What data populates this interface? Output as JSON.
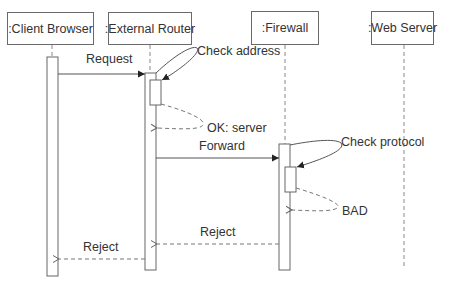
{
  "diagram": {
    "type": "sequence",
    "lifelines": [
      {
        "id": "client",
        "label": ":Client Browser"
      },
      {
        "id": "router",
        "label": ":External Router"
      },
      {
        "id": "firewall",
        "label": ":Firewall"
      },
      {
        "id": "webserver",
        "label": ":Web Server"
      }
    ],
    "messages": [
      {
        "from": "client",
        "to": "router",
        "label": "Request",
        "style": "solid"
      },
      {
        "from": "router",
        "to": "router",
        "label": "Check address",
        "style": "solid-self"
      },
      {
        "from": "router",
        "to": "router",
        "label": "OK: server",
        "style": "dashed-return"
      },
      {
        "from": "router",
        "to": "firewall",
        "label": "Forward",
        "style": "solid"
      },
      {
        "from": "firewall",
        "to": "firewall",
        "label": "Check protocol",
        "style": "solid-self"
      },
      {
        "from": "firewall",
        "to": "firewall",
        "label": "BAD",
        "style": "dashed-return"
      },
      {
        "from": "firewall",
        "to": "router",
        "label": "Reject",
        "style": "dashed-return"
      },
      {
        "from": "router",
        "to": "client",
        "label": "Reject",
        "style": "dashed-return"
      }
    ]
  },
  "colors": {
    "line": "#555555",
    "dashed": "#777777",
    "text": "#333333"
  }
}
